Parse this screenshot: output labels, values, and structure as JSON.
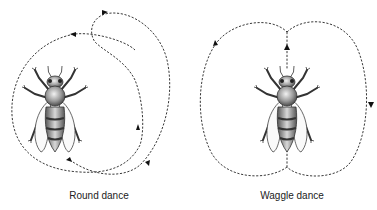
{
  "figure": {
    "panels": [
      {
        "id": "round",
        "label": "Round dance"
      },
      {
        "id": "waggle",
        "label": "Waggle dance"
      }
    ],
    "colors": {
      "line": "#222222",
      "bee_body": "#8a8a8a",
      "background": "#ffffff"
    }
  }
}
